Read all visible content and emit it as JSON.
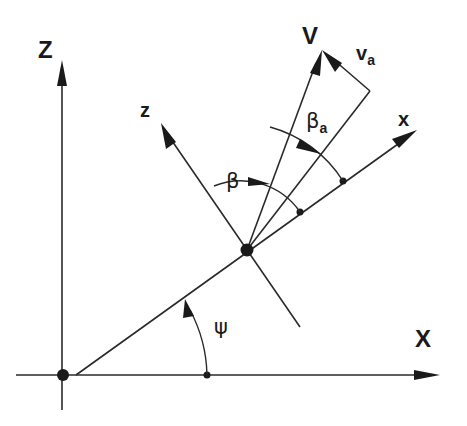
{
  "diagram": {
    "type": "coordinate-frame-diagram",
    "labels": {
      "global_vertical_axis": "Z",
      "global_horizontal_axis": "X",
      "body_longitudinal_axis": "x",
      "body_normal_axis": "z",
      "velocity_vector": "V",
      "relative_velocity_vector": "v",
      "relative_velocity_subscript": "a",
      "angle_beta": "β",
      "angle_beta_a": "β",
      "angle_beta_a_subscript": "a",
      "angle_psi": "ψ"
    },
    "colors": {
      "line": "#2a2a2a",
      "text": "#1a1a1a",
      "background": "#ffffff"
    }
  }
}
